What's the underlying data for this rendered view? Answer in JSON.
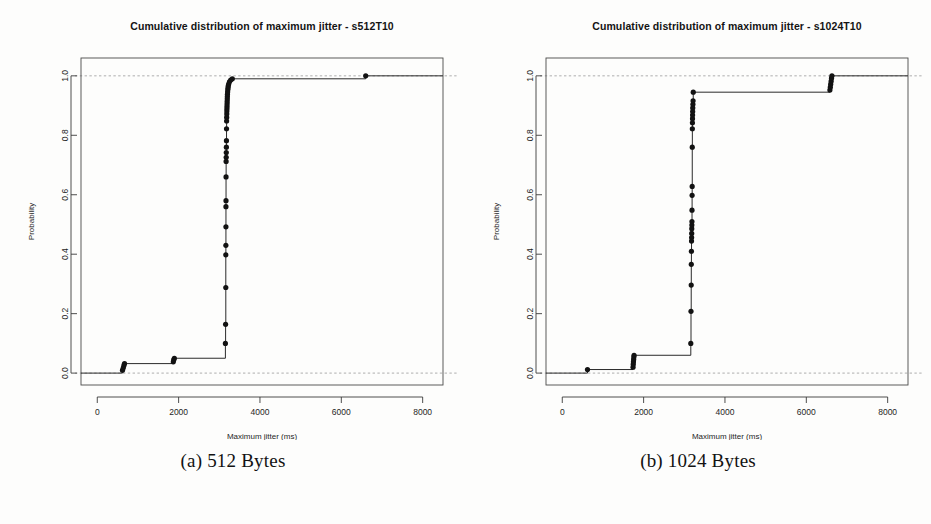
{
  "figure": {
    "caption_a": "(a) 512 Bytes",
    "caption_b": "(b) 1024 Bytes"
  },
  "colors": {
    "ink": "#141414",
    "curve": "#2a2a2a",
    "point": "#121212",
    "frame": "#4a4a4a",
    "guide": "#9a9a9a",
    "background": "#fdfdfc"
  },
  "chart_data": [
    {
      "type": "line",
      "panel": "a",
      "title": "Cumulative distribution of maximum jitter - s512T10",
      "xlabel": "Maximum jitter (ms)",
      "ylabel": "Probability",
      "xlim": [
        -400,
        8500
      ],
      "ylim": [
        -0.04,
        1.06
      ],
      "xticks": [
        0,
        2000,
        4000,
        6000,
        8000
      ],
      "xticklabels": [
        "0",
        "2000",
        "4000",
        "6000",
        "8000"
      ],
      "yticks": [
        0.0,
        0.2,
        0.4,
        0.6,
        0.8,
        1.0
      ],
      "yticklabels": [
        "0.0",
        "0.2",
        "0.4",
        "0.6",
        "0.8",
        "1.0"
      ],
      "grid": false,
      "guides": [
        0.0,
        1.0
      ],
      "legend": null,
      "series": [
        {
          "name": "ECDF max jitter s512T10",
          "x": [
            620,
            640,
            655,
            670,
            1870,
            1880,
            1895,
            3150,
            3155,
            3160,
            3160,
            3162,
            3163,
            3164,
            3165,
            3166,
            3168,
            3170,
            3172,
            3174,
            3176,
            3178,
            3180,
            3182,
            3184,
            3186,
            3188,
            3190,
            3192,
            3194,
            3196,
            3198,
            3200,
            3205,
            3210,
            3215,
            3220,
            3230,
            3250,
            3280,
            3320,
            6600
          ],
          "y": [
            0.01,
            0.018,
            0.026,
            0.032,
            0.038,
            0.045,
            0.05,
            0.1,
            0.164,
            0.288,
            0.398,
            0.43,
            0.492,
            0.56,
            0.58,
            0.66,
            0.712,
            0.726,
            0.742,
            0.76,
            0.782,
            0.822,
            0.848,
            0.86,
            0.872,
            0.882,
            0.89,
            0.898,
            0.906,
            0.914,
            0.922,
            0.93,
            0.938,
            0.946,
            0.954,
            0.96,
            0.966,
            0.972,
            0.98,
            0.986,
            0.99,
            1.0
          ]
        }
      ]
    },
    {
      "type": "line",
      "panel": "b",
      "title": "Cumulative distribution of maximum jitter - s1024T10",
      "xlabel": "Maximum jitter (ms)",
      "ylabel": "Probability",
      "xlim": [
        -400,
        8500
      ],
      "ylim": [
        -0.04,
        1.06
      ],
      "xticks": [
        0,
        2000,
        4000,
        6000,
        8000
      ],
      "xticklabels": [
        "0",
        "2000",
        "4000",
        "6000",
        "8000"
      ],
      "yticks": [
        0.0,
        0.2,
        0.4,
        0.6,
        0.8,
        1.0
      ],
      "yticklabels": [
        "0.0",
        "0.2",
        "0.4",
        "0.6",
        "0.8",
        "1.0"
      ],
      "grid": false,
      "guides": [
        0.0,
        1.0
      ],
      "legend": null,
      "series": [
        {
          "name": "ECDF max jitter s1024T10",
          "x": [
            620,
            1740,
            1745,
            1750,
            1755,
            1760,
            1765,
            3160,
            3165,
            3170,
            3172,
            3175,
            3178,
            3180,
            3182,
            3184,
            3186,
            3188,
            3190,
            3192,
            3194,
            3196,
            3198,
            3200,
            3202,
            3204,
            3206,
            3208,
            3212,
            3216,
            3220,
            6580,
            6590,
            6600,
            6610,
            6620,
            6630
          ],
          "y": [
            0.012,
            0.02,
            0.03,
            0.038,
            0.046,
            0.054,
            0.06,
            0.1,
            0.208,
            0.296,
            0.366,
            0.41,
            0.444,
            0.456,
            0.47,
            0.486,
            0.498,
            0.51,
            0.548,
            0.598,
            0.628,
            0.76,
            0.822,
            0.842,
            0.856,
            0.868,
            0.88,
            0.892,
            0.904,
            0.916,
            0.945,
            0.952,
            0.962,
            0.972,
            0.982,
            0.992,
            1.0
          ]
        }
      ]
    }
  ]
}
